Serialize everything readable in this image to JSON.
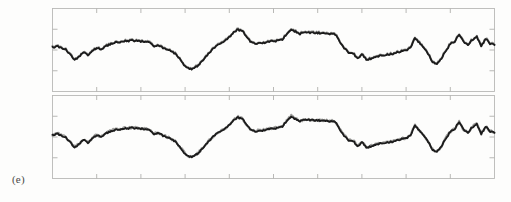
{
  "figure": {
    "panel_label": "(e)",
    "background_color": "#fdfdfc",
    "frame_color": "#b9b9b7",
    "tick_color": "#b0b0ae"
  },
  "chart_data": [
    {
      "type": "line",
      "title": "",
      "subtitle": "",
      "xlabel": "",
      "ylabel": "",
      "panel": "upper",
      "grid": false,
      "legend_position": "none",
      "xlim": [
        0,
        100
      ],
      "ylim": [
        -1.0,
        1.0
      ],
      "xticks": [
        0,
        10,
        20,
        30,
        40,
        50,
        60,
        70,
        80,
        90,
        100
      ],
      "xticklabels": [
        "",
        "",
        "",
        "",
        "",
        "",
        "",
        "",
        "",
        "",
        ""
      ],
      "yticks": [
        -0.5,
        0.0,
        0.5
      ],
      "yticklabels": [
        "",
        "",
        ""
      ],
      "series": [
        {
          "name": "measured",
          "color": "#8d8d8b",
          "x": [
            0,
            1,
            2,
            3,
            4,
            5,
            6,
            7,
            8,
            9,
            10,
            11,
            12,
            13,
            14,
            15,
            16,
            17,
            18,
            19,
            20,
            21,
            22,
            23,
            24,
            25,
            26,
            27,
            28,
            29,
            30,
            31,
            32,
            33,
            34,
            35,
            36,
            37,
            38,
            39,
            40,
            41,
            42,
            43,
            44,
            45,
            46,
            47,
            48,
            49,
            50,
            51,
            52,
            53,
            54,
            55,
            56,
            57,
            58,
            59,
            60,
            61,
            62,
            63,
            64,
            65,
            66,
            67,
            68,
            69,
            70,
            71,
            72,
            73,
            74,
            75,
            76,
            77,
            78,
            79,
            80,
            81,
            82,
            83,
            84,
            85,
            86,
            87,
            88,
            89,
            90,
            91,
            92,
            93,
            94,
            95,
            96,
            97,
            98,
            99,
            100
          ],
          "values": [
            0.07,
            0.1,
            0.06,
            0.02,
            -0.1,
            -0.23,
            -0.15,
            -0.04,
            -0.11,
            -0.02,
            0.06,
            0.03,
            0.1,
            0.15,
            0.19,
            0.2,
            0.22,
            0.23,
            0.24,
            0.23,
            0.22,
            0.21,
            0.18,
            0.1,
            0.12,
            0.06,
            0.02,
            -0.03,
            -0.1,
            -0.22,
            -0.38,
            -0.45,
            -0.43,
            -0.36,
            -0.24,
            -0.12,
            0.0,
            0.11,
            0.15,
            0.22,
            0.32,
            0.45,
            0.5,
            0.47,
            0.3,
            0.2,
            0.16,
            0.19,
            0.18,
            0.22,
            0.21,
            0.25,
            0.27,
            0.4,
            0.52,
            0.45,
            0.4,
            0.44,
            0.43,
            0.42,
            0.42,
            0.41,
            0.4,
            0.4,
            0.38,
            0.22,
            0.06,
            -0.05,
            -0.06,
            -0.2,
            -0.09,
            -0.22,
            -0.2,
            -0.16,
            -0.13,
            -0.11,
            -0.1,
            -0.08,
            -0.05,
            -0.02,
            0.0,
            0.06,
            0.3,
            0.18,
            0.06,
            -0.08,
            -0.28,
            -0.33,
            -0.2,
            0.0,
            0.15,
            0.22,
            0.38,
            0.2,
            0.14,
            0.26,
            0.34,
            0.1,
            0.28,
            0.16,
            0.13
          ]
        },
        {
          "name": "model",
          "color": "#1b1b1b",
          "x": [
            0,
            1,
            2,
            3,
            4,
            5,
            6,
            7,
            8,
            9,
            10,
            11,
            12,
            13,
            14,
            15,
            16,
            17,
            18,
            19,
            20,
            21,
            22,
            23,
            24,
            25,
            26,
            27,
            28,
            29,
            30,
            31,
            32,
            33,
            34,
            35,
            36,
            37,
            38,
            39,
            40,
            41,
            42,
            43,
            44,
            45,
            46,
            47,
            48,
            49,
            50,
            51,
            52,
            53,
            54,
            55,
            56,
            57,
            58,
            59,
            60,
            61,
            62,
            63,
            64,
            65,
            66,
            67,
            68,
            69,
            70,
            71,
            72,
            73,
            74,
            75,
            76,
            77,
            78,
            79,
            80,
            81,
            82,
            83,
            84,
            85,
            86,
            87,
            88,
            89,
            90,
            91,
            92,
            93,
            94,
            95,
            96,
            97,
            98,
            99,
            100
          ],
          "values": [
            0.06,
            0.09,
            0.05,
            0.01,
            -0.11,
            -0.24,
            -0.16,
            -0.05,
            -0.12,
            -0.03,
            0.05,
            0.02,
            0.09,
            0.14,
            0.18,
            0.19,
            0.21,
            0.22,
            0.23,
            0.22,
            0.21,
            0.2,
            0.17,
            0.09,
            0.11,
            0.05,
            0.01,
            -0.04,
            -0.11,
            -0.23,
            -0.39,
            -0.46,
            -0.44,
            -0.37,
            -0.25,
            -0.13,
            -0.01,
            0.1,
            0.14,
            0.21,
            0.31,
            0.44,
            0.49,
            0.46,
            0.29,
            0.19,
            0.15,
            0.18,
            0.17,
            0.21,
            0.2,
            0.24,
            0.26,
            0.39,
            0.5,
            0.44,
            0.39,
            0.43,
            0.42,
            0.41,
            0.41,
            0.4,
            0.39,
            0.39,
            0.37,
            0.21,
            0.05,
            -0.06,
            -0.07,
            -0.21,
            -0.1,
            -0.23,
            -0.21,
            -0.17,
            -0.14,
            -0.12,
            -0.11,
            -0.09,
            -0.06,
            -0.03,
            -0.01,
            0.05,
            0.29,
            0.17,
            0.05,
            -0.09,
            -0.29,
            -0.34,
            -0.21,
            -0.01,
            0.14,
            0.21,
            0.37,
            0.19,
            0.13,
            0.25,
            0.33,
            0.09,
            0.27,
            0.15,
            0.12
          ]
        }
      ]
    },
    {
      "type": "line",
      "title": "",
      "subtitle": "",
      "xlabel": "",
      "ylabel": "",
      "panel": "lower",
      "grid": false,
      "legend_position": "none",
      "xlim": [
        0,
        100
      ],
      "ylim": [
        -1.0,
        1.0
      ],
      "xticks": [
        0,
        10,
        20,
        30,
        40,
        50,
        60,
        70,
        80,
        90,
        100
      ],
      "xticklabels": [
        "",
        "",
        "",
        "",
        "",
        "",
        "",
        "",
        "",
        "",
        ""
      ],
      "yticks": [
        -0.5,
        0.0,
        0.5
      ],
      "yticklabels": [
        "",
        "",
        ""
      ],
      "series": [
        {
          "name": "measured",
          "color": "#8d8d8b",
          "x": [
            0,
            1,
            2,
            3,
            4,
            5,
            6,
            7,
            8,
            9,
            10,
            11,
            12,
            13,
            14,
            15,
            16,
            17,
            18,
            19,
            20,
            21,
            22,
            23,
            24,
            25,
            26,
            27,
            28,
            29,
            30,
            31,
            32,
            33,
            34,
            35,
            36,
            37,
            38,
            39,
            40,
            41,
            42,
            43,
            44,
            45,
            46,
            47,
            48,
            49,
            50,
            51,
            52,
            53,
            54,
            55,
            56,
            57,
            58,
            59,
            60,
            61,
            62,
            63,
            64,
            65,
            66,
            67,
            68,
            69,
            70,
            71,
            72,
            73,
            74,
            75,
            76,
            77,
            78,
            79,
            80,
            81,
            82,
            83,
            84,
            85,
            86,
            87,
            88,
            89,
            90,
            91,
            92,
            93,
            94,
            95,
            96,
            97,
            98,
            99,
            100
          ],
          "values": [
            0.05,
            0.09,
            0.04,
            0.0,
            -0.12,
            -0.25,
            -0.16,
            -0.05,
            -0.13,
            -0.03,
            0.05,
            0.02,
            0.09,
            0.14,
            0.18,
            0.19,
            0.21,
            0.22,
            0.23,
            0.22,
            0.21,
            0.2,
            0.16,
            0.08,
            0.11,
            0.04,
            0.0,
            -0.05,
            -0.12,
            -0.25,
            -0.4,
            -0.47,
            -0.45,
            -0.38,
            -0.26,
            -0.14,
            -0.02,
            0.09,
            0.13,
            0.2,
            0.3,
            0.43,
            0.48,
            0.45,
            0.28,
            0.18,
            0.14,
            0.17,
            0.17,
            0.21,
            0.2,
            0.24,
            0.27,
            0.4,
            0.51,
            0.44,
            0.39,
            0.43,
            0.42,
            0.41,
            0.41,
            0.4,
            0.39,
            0.39,
            0.37,
            0.2,
            0.04,
            -0.07,
            -0.08,
            -0.22,
            -0.11,
            -0.24,
            -0.22,
            -0.18,
            -0.15,
            -0.13,
            -0.12,
            -0.1,
            -0.07,
            -0.04,
            -0.02,
            0.04,
            0.29,
            0.16,
            0.04,
            -0.1,
            -0.3,
            -0.35,
            -0.22,
            -0.02,
            0.13,
            0.21,
            0.37,
            0.18,
            0.12,
            0.25,
            0.33,
            0.08,
            0.26,
            0.14,
            0.11
          ]
        },
        {
          "name": "model",
          "color": "#1b1b1b",
          "x": [
            0,
            1,
            2,
            3,
            4,
            5,
            6,
            7,
            8,
            9,
            10,
            11,
            12,
            13,
            14,
            15,
            16,
            17,
            18,
            19,
            20,
            21,
            22,
            23,
            24,
            25,
            26,
            27,
            28,
            29,
            30,
            31,
            32,
            33,
            34,
            35,
            36,
            37,
            38,
            39,
            40,
            41,
            42,
            43,
            44,
            45,
            46,
            47,
            48,
            49,
            50,
            51,
            52,
            53,
            54,
            55,
            56,
            57,
            58,
            59,
            60,
            61,
            62,
            63,
            64,
            65,
            66,
            67,
            68,
            69,
            70,
            71,
            72,
            73,
            74,
            75,
            76,
            77,
            78,
            79,
            80,
            81,
            82,
            83,
            84,
            85,
            86,
            87,
            88,
            89,
            90,
            91,
            92,
            93,
            94,
            95,
            96,
            97,
            98,
            99,
            100
          ],
          "values": [
            0.04,
            0.08,
            0.03,
            -0.01,
            -0.13,
            -0.26,
            -0.17,
            -0.06,
            -0.14,
            -0.04,
            0.04,
            0.01,
            0.08,
            0.13,
            0.17,
            0.18,
            0.2,
            0.21,
            0.22,
            0.21,
            0.2,
            0.19,
            0.15,
            0.07,
            0.1,
            0.03,
            -0.01,
            -0.06,
            -0.13,
            -0.26,
            -0.41,
            -0.48,
            -0.46,
            -0.39,
            -0.27,
            -0.15,
            -0.03,
            0.08,
            0.12,
            0.19,
            0.29,
            0.42,
            0.47,
            0.44,
            0.27,
            0.17,
            0.13,
            0.16,
            0.16,
            0.2,
            0.19,
            0.23,
            0.26,
            0.39,
            0.5,
            0.43,
            0.38,
            0.42,
            0.41,
            0.4,
            0.4,
            0.39,
            0.38,
            0.38,
            0.36,
            0.19,
            0.03,
            -0.08,
            -0.09,
            -0.23,
            -0.12,
            -0.25,
            -0.23,
            -0.19,
            -0.16,
            -0.14,
            -0.13,
            -0.11,
            -0.08,
            -0.05,
            -0.03,
            0.03,
            0.28,
            0.15,
            0.03,
            -0.11,
            -0.31,
            -0.36,
            -0.23,
            -0.03,
            0.12,
            0.2,
            0.36,
            0.17,
            0.11,
            0.24,
            0.32,
            0.07,
            0.25,
            0.13,
            0.1
          ]
        }
      ]
    }
  ]
}
